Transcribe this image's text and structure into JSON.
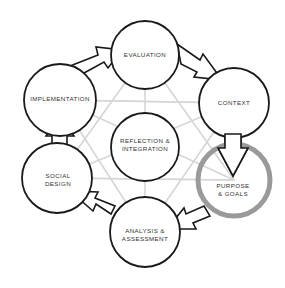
{
  "diagram": {
    "type": "cycle",
    "colors": {
      "stroke": "#1a1a1a",
      "highlight": "#9a9a9a",
      "grid": "#d6d6d6",
      "text": "#333333"
    },
    "center": {
      "id": "reflection",
      "line1": "REFLECTION &",
      "line2": "INTEGRATION"
    },
    "nodes": [
      {
        "id": "evaluation",
        "line1": "EVALUATION",
        "line2": ""
      },
      {
        "id": "context",
        "line1": "CONTEXT",
        "line2": ""
      },
      {
        "id": "purpose",
        "line1": "PURPOSE",
        "line2": "& GOALS",
        "highlighted": true
      },
      {
        "id": "analysis",
        "line1": "ANALYSIS &",
        "line2": "ASSESSMENT"
      },
      {
        "id": "social",
        "line1": "SOCIAL",
        "line2": "DESIGN"
      },
      {
        "id": "implementation",
        "line1": "IMPLEMENTATION",
        "line2": ""
      }
    ],
    "edges": [
      {
        "from": "implementation",
        "to": "evaluation"
      },
      {
        "from": "evaluation",
        "to": "context"
      },
      {
        "from": "context",
        "to": "purpose"
      },
      {
        "from": "purpose",
        "to": "analysis"
      },
      {
        "from": "analysis",
        "to": "social"
      },
      {
        "from": "social",
        "to": "implementation"
      }
    ]
  }
}
